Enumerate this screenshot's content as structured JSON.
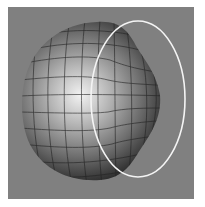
{
  "figure": {
    "colors": {
      "background": "#808080",
      "border": "#ffffff",
      "ellipse_stroke": "#f4f4f4",
      "highlight": "#f2f2f2",
      "shadow": "#1a1a1a",
      "grid_lines": "#222222"
    },
    "ellipse": {
      "cx": 138,
      "cy": 99,
      "rx": 47,
      "ry": 78
    }
  }
}
